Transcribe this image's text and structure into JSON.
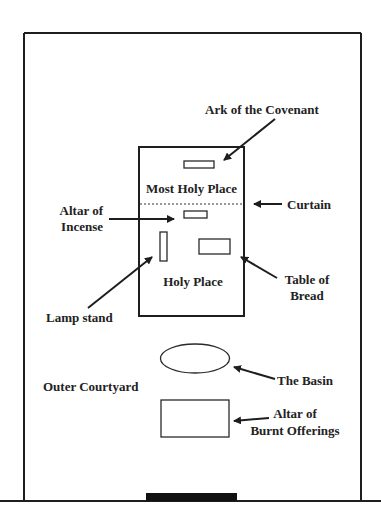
{
  "diagram": {
    "labels": {
      "ark": "Ark of the Covenant",
      "most_holy_place": "Most Holy Place",
      "curtain": "Curtain",
      "altar_incense_line1": "Altar of",
      "altar_incense_line2": "Incense",
      "holy_place": "Holy Place",
      "table_line1": "Table of",
      "table_line2": "Bread",
      "lamp_stand": "Lamp stand",
      "outer_courtyard": "Outer Courtyard",
      "basin": "The Basin",
      "altar_burnt_line1": "Altar of",
      "altar_burnt_line2": "Burnt Offerings"
    },
    "colors": {
      "stroke": "#1e1e1e",
      "text": "#222222",
      "background": "#ffffff",
      "gate": "#111111"
    },
    "regions": [
      "Outer Courtyard",
      "Holy Place",
      "Most Holy Place"
    ],
    "furnishings": [
      "Ark of the Covenant",
      "Altar of Incense",
      "Lamp stand",
      "Table of Bread",
      "The Basin",
      "Altar of Burnt Offerings"
    ]
  }
}
